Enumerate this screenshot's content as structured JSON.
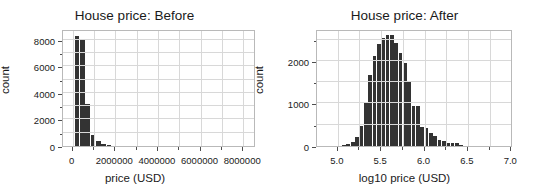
{
  "figure": {
    "background": "#ffffff",
    "bar_color": "#333333",
    "grid_color": "#d8d8d8",
    "frame_color": "#b9b9b9"
  },
  "chart_data": [
    {
      "type": "bar",
      "title": "House price: Before",
      "xlabel": "price (USD)",
      "ylabel": "count",
      "xlim": [
        -450000,
        8600000
      ],
      "ylim": [
        0,
        8800
      ],
      "grid": true,
      "legend": null,
      "xticks": [
        0,
        2000000,
        4000000,
        6000000,
        8000000
      ],
      "xtick_labels": [
        "0",
        "2000000",
        "4000000",
        "6000000",
        "8000000"
      ],
      "xticks_minor": [
        1000000,
        3000000,
        5000000,
        7000000
      ],
      "yticks": [
        0,
        2000,
        4000,
        6000,
        8000
      ],
      "ytick_labels": [
        "0",
        "2000",
        "4000",
        "6000",
        "8000"
      ],
      "yticks_minor": [
        1000,
        3000,
        5000,
        7000
      ],
      "bin_edges": [
        100000,
        350000,
        600000,
        850000,
        1100000,
        1350000,
        1600000,
        1850000
      ],
      "bin_centers": [
        225000,
        475000,
        725000,
        975000,
        1225000,
        1475000,
        1725000
      ],
      "values": [
        8300,
        8000,
        3150,
        850,
        350,
        120,
        40
      ]
    },
    {
      "type": "bar",
      "title": "House price: After",
      "xlabel": "log10 price (USD)",
      "ylabel": "count",
      "xlim": [
        4.76,
        7.02
      ],
      "ylim": [
        0,
        2750
      ],
      "grid": true,
      "legend": null,
      "xticks": [
        5.0,
        5.5,
        6.0,
        6.5,
        7.0
      ],
      "xtick_labels": [
        "5.0",
        "5.5",
        "6.0",
        "6.5",
        "7.0"
      ],
      "xticks_minor": [
        5.25,
        5.75,
        6.25,
        6.75
      ],
      "yticks": [
        0,
        1000,
        2000
      ],
      "ytick_labels": [
        "0",
        "1000",
        "2000"
      ],
      "yticks_minor": [
        500,
        1500,
        2500
      ],
      "bin_width": 0.05,
      "bin_centers": [
        5.075,
        5.125,
        5.175,
        5.225,
        5.275,
        5.325,
        5.375,
        5.425,
        5.475,
        5.525,
        5.575,
        5.625,
        5.675,
        5.725,
        5.775,
        5.825,
        5.875,
        5.925,
        5.975,
        6.025,
        6.075,
        6.125,
        6.175,
        6.225,
        6.275,
        6.325,
        6.375,
        6.425
      ],
      "values": [
        20,
        40,
        90,
        210,
        460,
        1000,
        1660,
        2110,
        2390,
        2540,
        2610,
        2600,
        2420,
        2180,
        1960,
        1510,
        930,
        930,
        450,
        420,
        300,
        230,
        130,
        120,
        80,
        70,
        60,
        30
      ]
    }
  ]
}
